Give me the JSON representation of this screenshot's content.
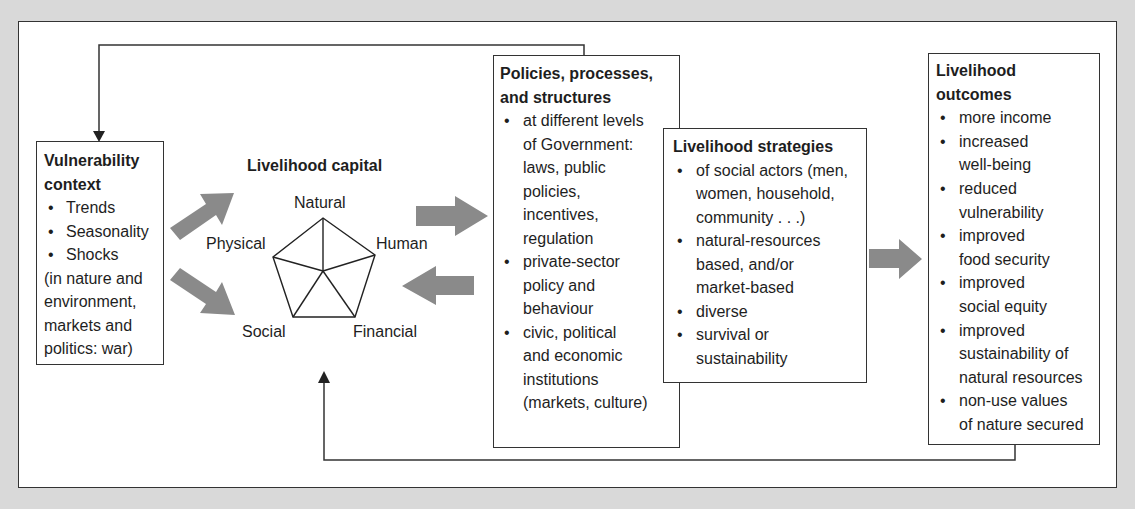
{
  "diagram": {
    "vulnerability": {
      "title_line1": "Vulnerability",
      "title_line2": "context",
      "items": [
        "Trends",
        "Seasonality",
        "Shocks"
      ],
      "note_lines": [
        "(in nature and",
        "environment,",
        "markets and",
        "politics: war)"
      ]
    },
    "capital": {
      "title": "Livelihood capital",
      "vertices": {
        "top": "Natural",
        "right": "Human",
        "bottom_right": "Financial",
        "bottom_left": "Social",
        "left": "Physical"
      }
    },
    "policies": {
      "title_line1": "Policies, processes,",
      "title_line2": "and structures",
      "items": [
        {
          "lines": [
            "at different levels",
            "of Government:",
            "laws, public",
            "policies,",
            "incentives,",
            "regulation"
          ]
        },
        {
          "lines": [
            "private-sector",
            "policy and",
            "behaviour"
          ]
        },
        {
          "lines": [
            "civic, political",
            "and economic",
            "institutions",
            "(markets, culture)"
          ]
        }
      ]
    },
    "strategies": {
      "title": "Livelihood strategies",
      "items": [
        {
          "lines": [
            "of social actors (men,",
            "women, household,",
            "community . . .)"
          ]
        },
        {
          "lines": [
            "natural-resources",
            "based, and/or",
            "market-based"
          ]
        },
        {
          "lines": [
            "diverse"
          ]
        },
        {
          "lines": [
            "survival or",
            "sustainability"
          ]
        }
      ]
    },
    "outcomes": {
      "title_line1": "Livelihood",
      "title_line2": "outcomes",
      "items": [
        {
          "lines": [
            "more income"
          ]
        },
        {
          "lines": [
            "increased",
            "well-being"
          ]
        },
        {
          "lines": [
            "reduced",
            "vulnerability"
          ]
        },
        {
          "lines": [
            "improved",
            "food security"
          ]
        },
        {
          "lines": [
            "improved",
            "social equity"
          ]
        },
        {
          "lines": [
            "improved",
            "sustainability of",
            "natural resources"
          ]
        },
        {
          "lines": [
            "non-use values",
            "of nature secured"
          ]
        }
      ]
    },
    "colors": {
      "background": "#d9d9d9",
      "frame": "#ffffff",
      "line": "#333333",
      "arrow_fill": "#8a8a8a"
    }
  }
}
